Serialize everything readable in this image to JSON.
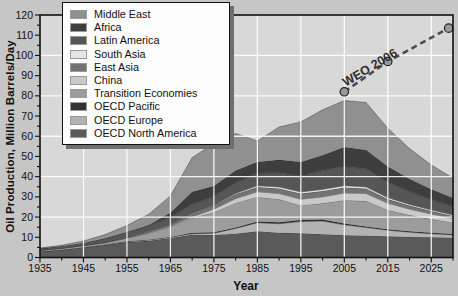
{
  "figure": {
    "ylabel": "Oil Production, Million Barrels/Day",
    "xlabel": "Year"
  },
  "palette": {
    "outer_bg": "#c6c6c6",
    "plot_bg": "#d8d8d8",
    "grid": "#ffffff",
    "frame": "#111111",
    "tick_text": "#111111",
    "band_edge": "rgba(0,0,0,0.4)",
    "weo_line": "#4d4d4d",
    "weo_marker_fill": "#999999",
    "weo_marker_stroke": "#222222",
    "weo_text": "#2e2e2e"
  },
  "chart_data": {
    "type": "area",
    "stacked": true,
    "title": "",
    "xlabel": "Year",
    "ylabel": "Oil Production, Million Barrels/Day",
    "xlim": [
      1935,
      2030
    ],
    "ylim": [
      0,
      120
    ],
    "xticks": [
      1935,
      1945,
      1955,
      1965,
      1975,
      1985,
      1995,
      2005,
      2015,
      2025
    ],
    "yticks": [
      0,
      10,
      20,
      30,
      40,
      50,
      60,
      70,
      80,
      90,
      100,
      110,
      120
    ],
    "grid_y_values": [
      20,
      40,
      60,
      80,
      100
    ],
    "grid_on": true,
    "legend_position": "top-left",
    "legend_order_top_to_bottom": [
      "Middle East",
      "Africa",
      "Latin America",
      "South Asia",
      "East Asia",
      "China",
      "Transition Economies",
      "OECD Pacific",
      "OECD Europe",
      "OECD North America"
    ],
    "x": [
      1935,
      1940,
      1945,
      1950,
      1955,
      1960,
      1965,
      1970,
      1975,
      1980,
      1985,
      1990,
      1995,
      2000,
      2005,
      2010,
      2015,
      2020,
      2025,
      2030
    ],
    "series": [
      {
        "name": "oecd-north-america",
        "label": "OECD North America",
        "color": "#5a5a5a",
        "values": [
          2.8,
          3.7,
          5.0,
          6.2,
          7.6,
          8.3,
          9.6,
          11.3,
          11.2,
          11.8,
          13.0,
          12.2,
          12.0,
          11.5,
          11.0,
          10.8,
          10.5,
          10.2,
          10.0,
          9.8
        ]
      },
      {
        "name": "oecd-europe",
        "label": "OECD Europe",
        "color": "#b3b3b3",
        "values": [
          0.1,
          0.1,
          0.1,
          0.2,
          0.3,
          0.4,
          0.4,
          0.5,
          0.8,
          2.6,
          4.2,
          4.5,
          5.8,
          6.5,
          5.2,
          4.0,
          3.0,
          2.3,
          1.8,
          1.4
        ]
      },
      {
        "name": "oecd-pacific",
        "label": "OECD Pacific",
        "color": "#333333",
        "values": [
          0.0,
          0.0,
          0.0,
          0.0,
          0.1,
          0.1,
          0.2,
          0.4,
          0.5,
          0.5,
          0.6,
          0.7,
          0.8,
          0.8,
          0.6,
          0.6,
          0.5,
          0.5,
          0.4,
          0.4
        ]
      },
      {
        "name": "transition-economies",
        "label": "Transition Economies",
        "color": "#9c9c9c",
        "values": [
          0.6,
          0.7,
          0.8,
          0.9,
          1.6,
          3.2,
          5.0,
          7.3,
          9.9,
          12.1,
          12.2,
          11.4,
          7.2,
          8.0,
          11.5,
          12.5,
          9.5,
          8.0,
          6.8,
          5.6
        ]
      },
      {
        "name": "china",
        "label": "China",
        "color": "#c9c9c9",
        "values": [
          0.0,
          0.0,
          0.0,
          0.0,
          0.1,
          0.2,
          0.3,
          0.6,
          1.5,
          2.1,
          2.5,
          2.8,
          3.0,
          3.2,
          3.6,
          3.7,
          3.3,
          2.9,
          2.5,
          2.1
        ]
      },
      {
        "name": "east-asia",
        "label": "East Asia",
        "color": "#737373",
        "values": [
          0.2,
          0.2,
          0.2,
          0.3,
          0.4,
          0.5,
          0.7,
          1.3,
          1.8,
          2.2,
          2.4,
          2.6,
          2.8,
          2.9,
          2.8,
          2.5,
          2.1,
          1.8,
          1.5,
          1.2
        ]
      },
      {
        "name": "south-asia",
        "label": "South Asia",
        "color": "#e6e6e6",
        "values": [
          0.0,
          0.0,
          0.0,
          0.0,
          0.0,
          0.1,
          0.1,
          0.2,
          0.2,
          0.3,
          0.6,
          0.7,
          0.8,
          0.8,
          0.8,
          0.8,
          0.7,
          0.6,
          0.5,
          0.5
        ]
      },
      {
        "name": "latin-america",
        "label": "Latin America",
        "color": "#565656",
        "values": [
          0.7,
          0.9,
          1.1,
          1.8,
          2.4,
          3.0,
          3.6,
          4.8,
          4.4,
          5.4,
          6.3,
          7.0,
          8.0,
          9.3,
          9.6,
          9.0,
          7.6,
          6.3,
          5.2,
          4.3
        ]
      },
      {
        "name": "africa",
        "label": "Africa",
        "color": "#3e3e3e",
        "values": [
          0.0,
          0.0,
          0.0,
          0.1,
          0.1,
          0.3,
          2.2,
          6.1,
          5.1,
          6.1,
          5.4,
          6.5,
          6.9,
          7.6,
          9.6,
          9.3,
          7.8,
          6.3,
          5.1,
          4.2
        ]
      },
      {
        "name": "middle-east",
        "label": "Middle East",
        "color": "#909090",
        "values": [
          0.3,
          0.5,
          1.0,
          1.9,
          3.3,
          5.3,
          8.4,
          17.0,
          21.0,
          18.3,
          10.5,
          16.2,
          19.8,
          22.5,
          23.0,
          23.5,
          19.0,
          15.0,
          12.0,
          9.8
        ]
      }
    ],
    "overlay_line": {
      "label": "WEO 2006",
      "style": "dashed",
      "points": [
        [
          2005,
          82
        ],
        [
          2015,
          97
        ],
        [
          2029,
          113.5
        ]
      ]
    }
  }
}
